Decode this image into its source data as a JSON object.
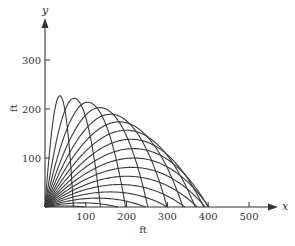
{
  "chart_data": {
    "type": "line",
    "title": "",
    "xlabel": "ft",
    "ylabel": "ft",
    "x_axis_var": "x",
    "y_axis_var": "y",
    "xlim": [
      0,
      550
    ],
    "ylim": [
      0,
      330
    ],
    "x_ticks": [
      100,
      200,
      300,
      400,
      500
    ],
    "y_ticks": [
      100,
      200,
      300
    ],
    "grid": false,
    "legend": null,
    "series": [
      {
        "name": "theta=5",
        "angle_deg": 5
      },
      {
        "name": "theta=10",
        "angle_deg": 10
      },
      {
        "name": "theta=15",
        "angle_deg": 15
      },
      {
        "name": "theta=20",
        "angle_deg": 20
      },
      {
        "name": "theta=25",
        "angle_deg": 25
      },
      {
        "name": "theta=30",
        "angle_deg": 30
      },
      {
        "name": "theta=35",
        "angle_deg": 35
      },
      {
        "name": "theta=40",
        "angle_deg": 40
      },
      {
        "name": "theta=45",
        "angle_deg": 45
      },
      {
        "name": "theta=50",
        "angle_deg": 50
      },
      {
        "name": "theta=55",
        "angle_deg": 55
      },
      {
        "name": "theta=60",
        "angle_deg": 60
      },
      {
        "name": "theta=65",
        "angle_deg": 65
      },
      {
        "name": "theta=70",
        "angle_deg": 70
      },
      {
        "name": "theta=75",
        "angle_deg": 75
      },
      {
        "name": "theta=80",
        "angle_deg": 80
      },
      {
        "name": "theta=85",
        "angle_deg": 85
      }
    ],
    "approx_landing_ranges_ft": [
      100,
      190,
      275,
      350,
      410,
      470,
      490,
      505
    ],
    "approx_max_height_ft": 250,
    "sim": {
      "v0": 140,
      "g": 32,
      "k": 0.0012,
      "dt": 0.01
    }
  },
  "axes": {
    "x_label": "x",
    "y_label": "y",
    "x_unit": "ft",
    "y_unit": "ft",
    "x_tick_labels": [
      "100",
      "200",
      "300",
      "400",
      "500"
    ],
    "y_tick_labels": [
      "100",
      "200",
      "300"
    ]
  }
}
